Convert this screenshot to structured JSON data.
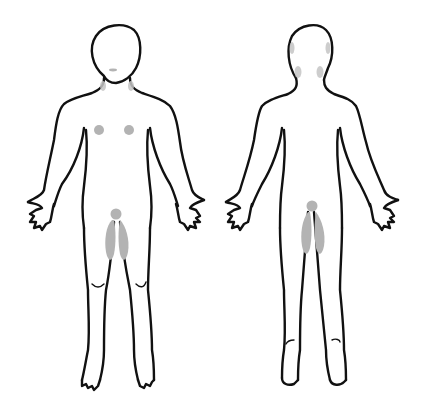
{
  "diagram": {
    "type": "body-map",
    "figures": [
      {
        "id": "front",
        "label": "Front view",
        "marked_regions": [
          "mouth",
          "neck-left",
          "neck-right",
          "chest-left",
          "chest-right",
          "genital-area",
          "inner-thigh-left",
          "inner-thigh-right"
        ]
      },
      {
        "id": "back",
        "label": "Back view",
        "marked_regions": [
          "ear-left",
          "ear-right",
          "neck-left",
          "neck-right",
          "anal-area",
          "buttock-left",
          "buttock-right"
        ]
      }
    ],
    "colors": {
      "outline": "#111111",
      "marked_region": "#b3b3b3",
      "background": "#ffffff"
    }
  }
}
